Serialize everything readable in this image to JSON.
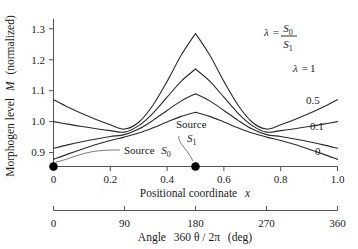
{
  "chart_data": {
    "type": "line",
    "title": "",
    "xlabel": "Positional coordinate  x",
    "xlabel2": "Angle  360 θ / 2π  (deg)",
    "ylabel": "Morphogen level  M  (normalized)",
    "xlim": [
      0,
      1.0
    ],
    "ylim": [
      0.855,
      1.33
    ],
    "xticks": [
      "0",
      "0.2",
      "0.4",
      "0.6",
      "0.8",
      "1.0"
    ],
    "xtick_values": [
      0,
      0.2,
      0.4,
      0.6,
      0.8,
      1.0
    ],
    "xticks2": [
      "0",
      "90",
      "180",
      "270",
      "360"
    ],
    "xtick2_values": [
      0,
      90,
      180,
      270,
      360
    ],
    "yticks": [
      "0.9",
      "1.0",
      "1.1",
      "1.2",
      "1.3"
    ],
    "ytick_values": [
      0.9,
      1.0,
      1.1,
      1.2,
      1.3
    ],
    "grid": false,
    "legend_position": "right-inside",
    "legend_title": "λ = S0 / S1",
    "series": [
      {
        "name": "λ = 1",
        "label": "1",
        "x": [
          0.0,
          0.05,
          0.1,
          0.15,
          0.2,
          0.25,
          0.3,
          0.35,
          0.4,
          0.45,
          0.5,
          0.55,
          0.6,
          0.65,
          0.7,
          0.75,
          0.8,
          0.85,
          0.9,
          0.95,
          1.0
        ],
        "values": [
          1.071,
          1.047,
          1.026,
          1.007,
          0.99,
          0.976,
          0.998,
          1.053,
          1.13,
          1.215,
          1.285,
          1.215,
          1.13,
          1.053,
          0.998,
          0.976,
          0.99,
          1.007,
          1.026,
          1.047,
          1.071
        ]
      },
      {
        "name": "λ = 0.5",
        "label": "0.5",
        "x": [
          0.0,
          0.05,
          0.1,
          0.15,
          0.2,
          0.25,
          0.3,
          0.35,
          0.4,
          0.45,
          0.5,
          0.55,
          0.6,
          0.65,
          0.7,
          0.75,
          0.8,
          0.85,
          0.9,
          0.95,
          1.0
        ],
        "values": [
          1.0,
          0.992,
          0.984,
          0.977,
          0.971,
          0.966,
          0.987,
          1.027,
          1.079,
          1.131,
          1.17,
          1.131,
          1.079,
          1.027,
          0.987,
          0.966,
          0.971,
          0.977,
          0.984,
          0.992,
          1.0
        ]
      },
      {
        "name": "λ = 0.1",
        "label": "0.1",
        "x": [
          0.0,
          0.05,
          0.1,
          0.15,
          0.2,
          0.25,
          0.3,
          0.35,
          0.4,
          0.45,
          0.5,
          0.55,
          0.6,
          0.65,
          0.7,
          0.75,
          0.8,
          0.85,
          0.9,
          0.95,
          1.0
        ],
        "values": [
          0.914,
          0.925,
          0.935,
          0.944,
          0.952,
          0.958,
          0.976,
          1.004,
          1.036,
          1.067,
          1.09,
          1.067,
          1.036,
          1.004,
          0.976,
          0.958,
          0.952,
          0.944,
          0.935,
          0.925,
          0.914
        ]
      },
      {
        "name": "λ = 0",
        "label": "0",
        "x": [
          0.0,
          0.05,
          0.1,
          0.15,
          0.2,
          0.25,
          0.3,
          0.35,
          0.4,
          0.45,
          0.5,
          0.55,
          0.6,
          0.65,
          0.7,
          0.75,
          0.8,
          0.85,
          0.9,
          0.95,
          1.0
        ],
        "values": [
          0.878,
          0.895,
          0.911,
          0.926,
          0.939,
          0.95,
          0.963,
          0.98,
          0.999,
          1.017,
          1.03,
          1.017,
          0.999,
          0.98,
          0.963,
          0.95,
          0.939,
          0.926,
          0.911,
          0.895,
          0.878
        ]
      }
    ],
    "annotations": [
      {
        "text": "Source  S0",
        "x": 0.0,
        "y": 0.855,
        "note": "marker dot at left end of x-axis"
      },
      {
        "text": "Source  S1",
        "x": 0.5,
        "y": 0.855,
        "note": "marker dot at mid x-axis"
      }
    ],
    "source_markers": [
      {
        "name": "S0",
        "x": 0.0
      },
      {
        "name": "S1",
        "x": 0.5
      }
    ]
  },
  "labels": {
    "ylabel_main": "Morphogen level",
    "ylabel_var": "M",
    "ylabel_unit": "(normalized)",
    "xlabel_main": "Positional coordinate",
    "xlabel_var": "x",
    "xlabel2_main": "Angle",
    "xlabel2_expr": "360 θ / 2π",
    "xlabel2_unit": "(deg)",
    "lambda_sym": "λ",
    "equals": "=",
    "numerator": "S",
    "numerator_sub": "0",
    "denominator": "S",
    "denominator_sub": "1",
    "lambda_one": "λ  = 1",
    "curve_05": "0.5",
    "curve_01": "0.1",
    "curve_0": "0",
    "source_word": "Source",
    "source_s": "S",
    "source_s0_sub": "0",
    "source_s1_sub": "1"
  },
  "colors": {
    "curve": "#2a2a2a",
    "axis": "#555555",
    "text": "#1a1a1a",
    "background": "#ffffff",
    "marker": "#000000"
  }
}
